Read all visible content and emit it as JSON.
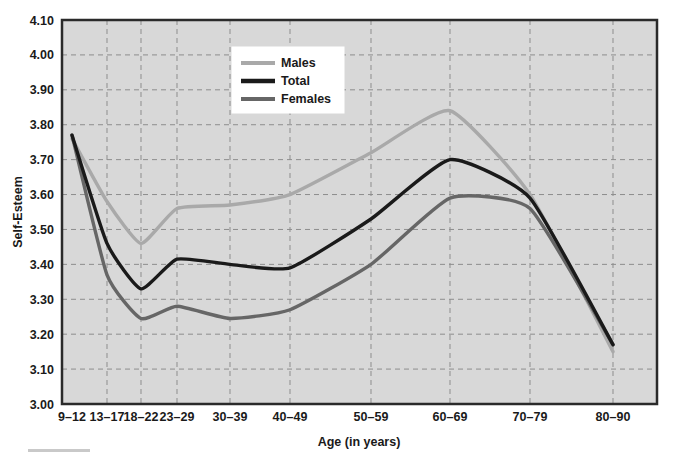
{
  "chart_data": {
    "type": "line",
    "title": "",
    "xlabel": "Age (in years)",
    "ylabel": "Self-Esteem",
    "categories": [
      "9–12",
      "13–17",
      "18–22",
      "23–29",
      "30–39",
      "40–49",
      "50–59",
      "60–69",
      "70–79",
      "80–90"
    ],
    "ylim": [
      3.0,
      4.1
    ],
    "yticks": [
      "3.00",
      "3.10",
      "3.20",
      "3.30",
      "3.40",
      "3.50",
      "3.60",
      "3.70",
      "3.80",
      "3.90",
      "4.00",
      "4.10"
    ],
    "ytick_values": [
      3.0,
      3.1,
      3.2,
      3.3,
      3.4,
      3.5,
      3.6,
      3.7,
      3.8,
      3.9,
      4.0,
      4.1
    ],
    "grid": true,
    "grid_style": "dashed",
    "legend_position": "top-center",
    "plot_background": "#d8d8d8",
    "series": [
      {
        "name": "Males",
        "color": "#a9a9a9",
        "values": [
          3.76,
          3.58,
          3.46,
          3.56,
          3.57,
          3.6,
          3.72,
          3.84,
          3.6,
          3.15
        ]
      },
      {
        "name": "Total",
        "color": "#1a1a1a",
        "values": [
          3.77,
          3.46,
          3.33,
          3.415,
          3.4,
          3.39,
          3.53,
          3.7,
          3.59,
          3.17
        ]
      },
      {
        "name": "Females",
        "color": "#666666",
        "values": [
          3.77,
          3.37,
          3.245,
          3.28,
          3.245,
          3.27,
          3.4,
          3.59,
          3.56,
          3.17
        ]
      }
    ]
  },
  "legend": {
    "entries": [
      {
        "label": "Males",
        "color": "#a9a9a9"
      },
      {
        "label": "Total",
        "color": "#1a1a1a"
      },
      {
        "label": "Females",
        "color": "#666666"
      }
    ]
  }
}
